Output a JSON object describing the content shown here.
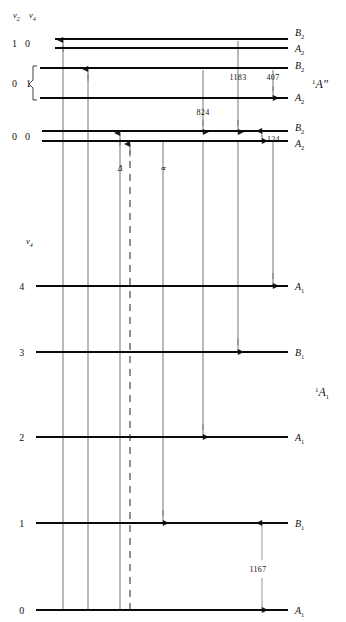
{
  "figure": {
    "kind": "energy-level-diagram",
    "width": 346,
    "height": 622,
    "background": "#ffffff",
    "level_color": "#0a0a0a",
    "transition_color": "#777777"
  },
  "header": {
    "quantum_axis_1": "ν",
    "quantum_axis_1_sub": "2",
    "quantum_axis_2": "ν",
    "quantum_axis_2_sub": "4"
  },
  "upper_block": {
    "state_label_pre": "1",
    "state_label": "A″",
    "quantum_rows": [
      {
        "v2": "1",
        "v4": "0"
      },
      {
        "v2": "0",
        "v4": "1"
      },
      {
        "v2": "0",
        "v4": "0"
      }
    ],
    "levels": [
      {
        "symbol": "B",
        "sub": "2",
        "y": 39
      },
      {
        "symbol": "A",
        "sub": "2",
        "y": 48
      },
      {
        "symbol": "B",
        "sub": "2",
        "y": 68
      },
      {
        "symbol": "A",
        "sub": "2",
        "y": 98
      },
      {
        "symbol": "B",
        "sub": "2",
        "y": 131
      },
      {
        "symbol": "A",
        "sub": "2",
        "y": 141
      }
    ],
    "annotations": [
      {
        "value": "1183",
        "x": 238,
        "y": 77
      },
      {
        "value": "407",
        "x": 273,
        "y": 77
      },
      {
        "value": "824",
        "x": 203,
        "y": 112
      },
      {
        "value": "124",
        "x": 272,
        "y": 138
      }
    ]
  },
  "lower_block": {
    "state_label_pre": "1",
    "state_label": "A",
    "state_label_sub": "1",
    "quantum_axis": "ν",
    "quantum_axis_sub": "4",
    "levels": [
      {
        "n": "4",
        "symbol": "A",
        "sub": "1",
        "y": 286
      },
      {
        "n": "3",
        "symbol": "B",
        "sub": "1",
        "y": 352
      },
      {
        "n": "2",
        "symbol": "A",
        "sub": "1",
        "y": 437
      },
      {
        "n": "1",
        "symbol": "B",
        "sub": "1",
        "y": 523
      },
      {
        "n": "0",
        "symbol": "A",
        "sub": "1",
        "y": 610
      }
    ],
    "annotations": [
      {
        "value": "1167",
        "x": 262,
        "y": 570
      }
    ]
  },
  "transition_marks": [
    {
      "label": "Δ",
      "x": 120,
      "y": 168
    },
    {
      "label": "∝",
      "x": 163,
      "y": 168
    }
  ],
  "transitions": [
    {
      "id": "abs-1",
      "x": 63,
      "from_y": 610,
      "to_y": 41,
      "direction": "up",
      "style": "solid"
    },
    {
      "id": "abs-2",
      "x": 88,
      "from_y": 610,
      "to_y": 70,
      "direction": "up",
      "style": "solid"
    },
    {
      "id": "abs-3",
      "x": 120,
      "from_y": 610,
      "to_y": 133,
      "direction": "up",
      "style": "solid"
    },
    {
      "id": "abs-4-dashed",
      "x": 130,
      "from_y": 610,
      "to_y": 143,
      "direction": "up",
      "style": "dashed"
    },
    {
      "id": "em-1",
      "x": 163,
      "from_y": 141,
      "to_y": 523,
      "direction": "down",
      "style": "solid"
    },
    {
      "id": "em-2",
      "x": 203,
      "from_y": 70,
      "to_y": 133,
      "direction": "down",
      "style": "solid"
    },
    {
      "id": "em-3",
      "x": 203,
      "from_y": 141,
      "to_y": 437,
      "direction": "down",
      "style": "solid"
    },
    {
      "id": "em-4",
      "x": 238,
      "from_y": 41,
      "to_y": 133,
      "direction": "down",
      "style": "solid"
    },
    {
      "id": "em-5",
      "x": 238,
      "from_y": 141,
      "to_y": 352,
      "direction": "down",
      "style": "solid"
    },
    {
      "id": "em-6",
      "x": 273,
      "from_y": 70,
      "to_y": 98,
      "direction": "down",
      "style": "solid"
    },
    {
      "id": "em-7",
      "x": 273,
      "from_y": 141,
      "to_y": 286,
      "direction": "down",
      "style": "solid"
    },
    {
      "id": "gap-124",
      "x": 262,
      "from_y": 131,
      "to_y": 141,
      "direction": "both",
      "style": "solid"
    },
    {
      "id": "gap-1167",
      "x": 262,
      "from_y": 523,
      "to_y": 610,
      "direction": "both",
      "style": "solid"
    }
  ]
}
